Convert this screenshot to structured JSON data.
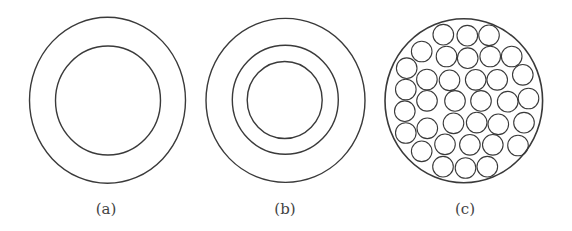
{
  "figure": {
    "stroke_color": "#3a3a3a",
    "background": "#ffffff",
    "panels": [
      {
        "id": "a",
        "label": "(a)",
        "label_x": 106,
        "description": "Two concentric circles",
        "rings": [
          {
            "cx": 107.5,
            "cy": 100.3,
            "rx": 78,
            "ry": 83
          },
          {
            "cx": 108,
            "cy": 100.5,
            "rx": 52.5,
            "ry": 54.5
          }
        ]
      },
      {
        "id": "b",
        "label": "(b)",
        "label_x": 285,
        "description": "Three concentric circles",
        "rings": [
          {
            "cx": 285.5,
            "cy": 100.4,
            "rx": 79.5,
            "ry": 82
          },
          {
            "cx": 285.3,
            "cy": 99.7,
            "rx": 53,
            "ry": 54.5
          },
          {
            "cx": 284.7,
            "cy": 100,
            "rx": 37.5,
            "ry": 38.5
          }
        ]
      },
      {
        "id": "c",
        "label": "(c)",
        "label_x": 465,
        "description": "Large circle filled with 35 small circles",
        "outer": {
          "cx": 463.8,
          "cy": 100.8,
          "rx": 78.8,
          "ry": 82
        },
        "small_radius": 10.3,
        "small_circles": [
          [
            443.3,
            34.7
          ],
          [
            467.3,
            35.7
          ],
          [
            489,
            35.3
          ],
          [
            421.7,
            51.5
          ],
          [
            446.5,
            56.5
          ],
          [
            467.7,
            58.2
          ],
          [
            490.2,
            56.5
          ],
          [
            511.7,
            56.5
          ],
          [
            406.7,
            68.2
          ],
          [
            426.9,
            79.5
          ],
          [
            449.5,
            80.3
          ],
          [
            475.7,
            79.8
          ],
          [
            497.2,
            79.8
          ],
          [
            522.8,
            74.8
          ],
          [
            405.8,
            89.5
          ],
          [
            427,
            100.8
          ],
          [
            455,
            100.9
          ],
          [
            481,
            100.9
          ],
          [
            507.7,
            101.7
          ],
          [
            528.5,
            98.5
          ],
          [
            404.8,
            111.2
          ],
          [
            405.8,
            133
          ],
          [
            427.3,
            128.3
          ],
          [
            453.5,
            123.3
          ],
          [
            476.7,
            122.6
          ],
          [
            498.3,
            124.3
          ],
          [
            524,
            122.7
          ],
          [
            421.7,
            151.3
          ],
          [
            445,
            144.3
          ],
          [
            469.9,
            144.8
          ],
          [
            492.8,
            144.8
          ],
          [
            518,
            145.5
          ],
          [
            443,
            166.7
          ],
          [
            465.5,
            168
          ],
          [
            487.3,
            166.7
          ]
        ]
      }
    ]
  }
}
